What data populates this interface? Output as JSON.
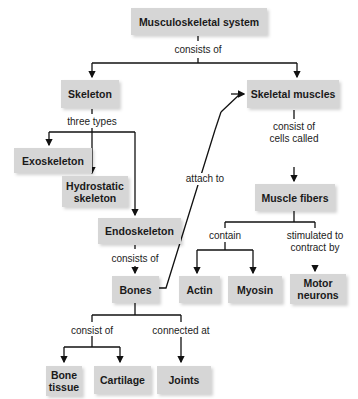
{
  "diagram": {
    "type": "concept-map",
    "nodes": {
      "musculoskeletal": "Musculoskeletal system",
      "skeleton": "Skeleton",
      "skeletal_muscles": "Skeletal muscles",
      "exoskeleton": "Exoskeleton",
      "hydrostatic_1": "Hydrostatic",
      "hydrostatic_2": "skeleton",
      "endoskeleton": "Endoskeleton",
      "bones": "Bones",
      "muscle_fibers": "Muscle fibers",
      "actin": "Actin",
      "myosin": "Myosin",
      "motor_1": "Motor",
      "motor_2": "neurons",
      "bone_tissue_1": "Bone",
      "bone_tissue_2": "tissue",
      "cartilage": "Cartilage",
      "joints": "Joints"
    },
    "labels": {
      "consists_of_top": "consists of",
      "three_types": "three types",
      "consists_of_endo": "consists of",
      "attach_to": "attach to",
      "consist_of_cells_1": "consist of",
      "consist_of_cells_2": "cells called",
      "contain": "contain",
      "stimulated_1": "stimulated to",
      "stimulated_2": "contract by",
      "consist_of_bones": "consist of",
      "connected_at": "connected at"
    },
    "edges": [
      {
        "from": "Musculoskeletal system",
        "to": "Skeleton",
        "label": "consists of"
      },
      {
        "from": "Musculoskeletal system",
        "to": "Skeletal muscles",
        "label": "consists of"
      },
      {
        "from": "Skeleton",
        "to": "Exoskeleton",
        "label": "three types"
      },
      {
        "from": "Skeleton",
        "to": "Hydrostatic skeleton",
        "label": "three types"
      },
      {
        "from": "Skeleton",
        "to": "Endoskeleton",
        "label": "three types"
      },
      {
        "from": "Endoskeleton",
        "to": "Bones",
        "label": "consists of"
      },
      {
        "from": "Bones",
        "to": "Skeletal muscles",
        "label": "attach to"
      },
      {
        "from": "Skeletal muscles",
        "to": "Muscle fibers",
        "label": "consist of cells called"
      },
      {
        "from": "Muscle fibers",
        "to": "Actin",
        "label": "contain"
      },
      {
        "from": "Muscle fibers",
        "to": "Myosin",
        "label": "contain"
      },
      {
        "from": "Muscle fibers",
        "to": "Motor neurons",
        "label": "stimulated to contract by"
      },
      {
        "from": "Bones",
        "to": "Bone tissue",
        "label": "consist of"
      },
      {
        "from": "Bones",
        "to": "Cartilage",
        "label": "consist of"
      },
      {
        "from": "Bones",
        "to": "Joints",
        "label": "connected at"
      }
    ]
  }
}
